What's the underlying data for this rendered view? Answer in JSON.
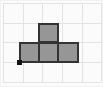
{
  "figure": {
    "title": "",
    "width": 103,
    "height": 87,
    "background_color": "#fbfbfb",
    "frame_color": "#f2f2f2"
  },
  "grid": {
    "visible": true,
    "line_color": "#e3e3e3",
    "columns": 5,
    "rows": 4,
    "cell_size": 20,
    "origin_x": 3,
    "origin_y": 3,
    "x_lines": [
      3,
      23,
      42,
      62,
      82,
      101
    ],
    "y_lines": [
      3,
      23,
      42,
      62,
      82
    ]
  },
  "shape": {
    "name": "t-tetromino",
    "label": "T",
    "fill_color": "#969696",
    "stroke_color": "#333333",
    "stroke_width": 2,
    "cell_count": 4,
    "cells": [
      {
        "name": "cell-top-center",
        "col": 2,
        "row": 1,
        "x": 38,
        "y": 23,
        "w": 21,
        "h": 20
      },
      {
        "name": "cell-bottom-left",
        "col": 1,
        "row": 2,
        "x": 19,
        "y": 42,
        "w": 21,
        "h": 21
      },
      {
        "name": "cell-bottom-center",
        "col": 2,
        "row": 2,
        "x": 38,
        "y": 42,
        "w": 21,
        "h": 21
      },
      {
        "name": "cell-bottom-right",
        "col": 3,
        "row": 2,
        "x": 57,
        "y": 42,
        "w": 22,
        "h": 21
      }
    ]
  },
  "origin_marker": {
    "name": "origin-point",
    "color": "#111111",
    "x": 17,
    "y": 60,
    "size": 5
  },
  "chart_data": {
    "type": "heatmap",
    "title": "",
    "xlabel": "",
    "ylabel": "",
    "grid": true,
    "legend": "none",
    "columns": 5,
    "rows": 4,
    "filled_cells": [
      [
        2,
        1
      ],
      [
        1,
        2
      ],
      [
        2,
        2
      ],
      [
        3,
        2
      ]
    ],
    "values": [
      [
        0,
        0,
        0,
        0,
        0
      ],
      [
        0,
        0,
        1,
        0,
        0
      ],
      [
        0,
        1,
        1,
        1,
        0
      ],
      [
        0,
        0,
        0,
        0,
        0
      ]
    ],
    "xlim": [
      0,
      5
    ],
    "ylim": [
      0,
      4
    ]
  }
}
